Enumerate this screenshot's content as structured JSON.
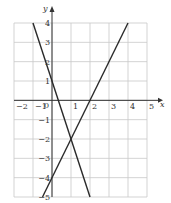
{
  "chart_data": {
    "type": "line",
    "title": "",
    "xlabel": "x",
    "ylabel": "y",
    "xlim": [
      -2,
      5
    ],
    "ylim": [
      -5,
      4
    ],
    "grid": true,
    "x_ticks": [
      "−2",
      "−1",
      "0",
      "1",
      "2",
      "3",
      "4",
      "5"
    ],
    "y_ticks": [
      "4",
      "3",
      "2",
      "1",
      "−1",
      "−2",
      "−3",
      "−4",
      "−5"
    ],
    "origin_label": "0",
    "series": [
      {
        "name": "y = -3x + 1",
        "points": [
          [
            -1,
            4
          ],
          [
            2,
            -5
          ]
        ]
      },
      {
        "name": "y = 2x - 4",
        "points": [
          [
            -0.5,
            -5
          ],
          [
            4,
            4
          ]
        ]
      }
    ],
    "annotations": [
      {
        "label": "intersection",
        "x": 1,
        "y": -2
      }
    ]
  }
}
